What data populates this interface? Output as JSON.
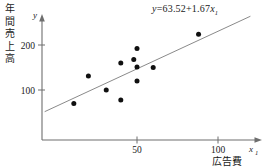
{
  "chart_data": {
    "type": "scatter",
    "title": "",
    "xlabel": "広告費",
    "ylabel": "年間売上高",
    "x_axis_name": "x",
    "x_axis_subscript": "1",
    "y_axis_name": "y",
    "xticks": [
      50,
      100
    ],
    "xtick_labels": [
      "50",
      "100"
    ],
    "yticks": [
      100,
      200
    ],
    "ytick_labels": [
      "100",
      "200"
    ],
    "xlim": [
      0,
      118
    ],
    "ylim": [
      0,
      258
    ],
    "grid": false,
    "legend": "none",
    "points": [
      {
        "x": 11,
        "y": 70
      },
      {
        "x": 20,
        "y": 131
      },
      {
        "x": 31,
        "y": 100
      },
      {
        "x": 40,
        "y": 160
      },
      {
        "x": 40,
        "y": 78
      },
      {
        "x": 48,
        "y": 168
      },
      {
        "x": 50,
        "y": 192
      },
      {
        "x": 50,
        "y": 151
      },
      {
        "x": 50,
        "y": 120
      },
      {
        "x": 60,
        "y": 150
      },
      {
        "x": 88,
        "y": 224
      }
    ],
    "regression": {
      "intercept": 63.52,
      "slope": 1.67,
      "x_start": -7,
      "x_end": 120,
      "equation_y": "y",
      "equation_eq": "=",
      "equation_intercept": "63.52",
      "equation_plus": "+",
      "equation_slope": "1.67",
      "equation_var": "x",
      "equation_sub": "1",
      "equation_full": "y = 63.52 + 1.67x1"
    },
    "colors": {
      "point": "#101010",
      "line": "#8a8a8a",
      "axis": "#6e6e6e",
      "text": "#1a1a1a",
      "background": "#ffffff"
    }
  },
  "ylabel_chars": [
    "年",
    "間",
    "売",
    "上",
    "高"
  ]
}
